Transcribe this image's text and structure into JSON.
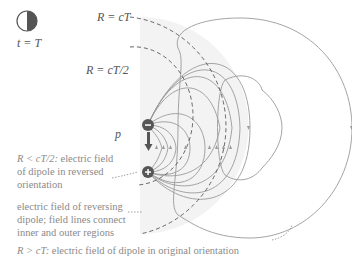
{
  "clock": {
    "icon": "clock-icon",
    "label": "t = T"
  },
  "radii": {
    "outer": "R = cT",
    "inner": "R = cT/2"
  },
  "dipole": {
    "vector_label": "p⃗",
    "negative_charge": "−",
    "positive_charge": "+"
  },
  "annotations": {
    "inner": {
      "math": "R < cT/2:",
      "text": "electric field of dipole in reversed orientation"
    },
    "middle": {
      "text": "electric field of reversing dipole; field lines connect inner and outer regions"
    },
    "outer": {
      "math": "R > cT:",
      "text": "electric field of dipole in original orientation"
    }
  },
  "colors": {
    "line": "#9a9a9a",
    "dashed": "#555555",
    "shade": "#f1f1f1",
    "charge": "#555555"
  }
}
